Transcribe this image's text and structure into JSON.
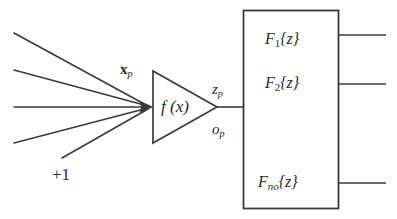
{
  "diagram": {
    "type": "neuron-with-output-function-block",
    "input_label": "x",
    "input_label_sub": "p",
    "bias_label": "+1",
    "neuron_label": "f (x)",
    "pre_activation_label": "z",
    "pre_activation_sub": "p",
    "output_label": "o",
    "output_sub": "p",
    "output_functions": [
      {
        "name": "F",
        "sub": "1",
        "arg": "{z}"
      },
      {
        "name": "F",
        "sub": "2",
        "arg": "{z}"
      },
      {
        "name": "F",
        "sub": "no",
        "arg": "{z}"
      }
    ],
    "input_line_count": 5,
    "output_line_count": 3,
    "stroke_color": "#3a3a3a",
    "text_color": "#2b2b2b",
    "background_color": "#ffffff"
  }
}
